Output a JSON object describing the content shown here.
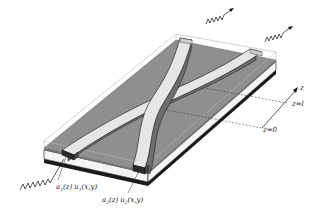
{
  "figure": {
    "type": "directional-coupler-schematic",
    "colors": {
      "background": "#ffffff",
      "substrate_top": "#8f8f8f",
      "cladding_outline": "#bdbdbd",
      "waveguide_top": "#e6e6e6",
      "waveguide_side": "#7a7a7a",
      "waveguide_end": "#2a2a2a",
      "buffer_layer": "#f2f2f2",
      "ground_layer": "#1a1a1a",
      "lines": "#111111"
    },
    "labels": {
      "mode1": {
        "a": "a",
        "a_sub": "1",
        "a_arg": "(z)",
        "u": "u",
        "u_sub": "1",
        "u_arg": "(x,y)"
      },
      "mode2": {
        "a": "a",
        "a_sub": "2",
        "a_arg": "(z)",
        "u": "u",
        "u_sub": "2",
        "u_arg": "(x,y)"
      },
      "z_axis": "z",
      "z_end": "z=l",
      "z_start": "z=0"
    },
    "waves": {
      "input": "incoming-wave",
      "output_1": "outgoing-wave-1",
      "output_2": "outgoing-wave-2"
    }
  }
}
